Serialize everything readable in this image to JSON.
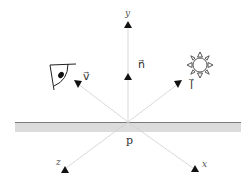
{
  "diagram": {
    "type": "reflection-geometry",
    "surface": {
      "line_color": "#777777",
      "fill_color": "#d9d9d9"
    },
    "axes": {
      "y_label": "y",
      "z_label": "z",
      "x_label": "x"
    },
    "vectors": {
      "normal_label": "n⃗",
      "view_label": "v⃗",
      "light_label": "l⃗"
    },
    "point_label": "p",
    "icons": {
      "viewer": "eye-icon",
      "light_source": "sun-icon"
    },
    "colors": {
      "ray": "#cccccc",
      "arrow": "#111111",
      "text": "#333333"
    }
  }
}
